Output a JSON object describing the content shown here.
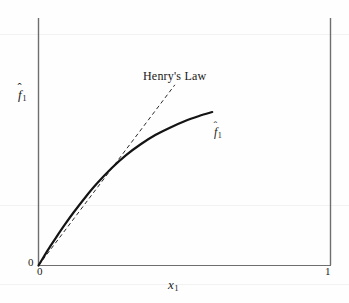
{
  "figure": {
    "background_color": "#fefefe",
    "ink_color": "#1a1a1a",
    "axis_color": "#6e6e6e"
  },
  "labels": {
    "y_axis_base": "f",
    "y_axis_hat": "ˆ",
    "y_axis_sub": "1",
    "y_axis_full": "f̂1",
    "x_axis_base": "x",
    "x_axis_sub": "1",
    "x_axis_full": "x1",
    "curve_base": "f",
    "curve_hat": "ˆ",
    "curve_sub": "1",
    "curve_full": "f̂1",
    "henry_law": "Henry's Law"
  },
  "ticks": {
    "y_origin": "0",
    "x_origin": "0",
    "x_max": "1"
  },
  "chart_data": {
    "type": "line",
    "title": "",
    "subtitle": "",
    "xlabel": "x1",
    "ylabel": "f̂1",
    "xlim": [
      0,
      1
    ],
    "ylim": [
      0,
      1
    ],
    "grid": false,
    "legend_position": "inline-annotations",
    "x_tick_labels": [
      "0",
      "1"
    ],
    "x_tick_values": [
      0,
      1
    ],
    "y_tick_labels": [
      "0"
    ],
    "y_tick_values": [
      0
    ],
    "annotations": [
      {
        "text": "Henry's Law",
        "x": 0.4,
        "y": 0.79,
        "describes": "dashed-line"
      },
      {
        "text": "f̂1",
        "x": 0.61,
        "y": 0.545,
        "describes": "solid-curve"
      }
    ],
    "series": [
      {
        "name": "fugacity-curve",
        "label": "f̂1",
        "style": "solid",
        "color": "#141414",
        "width": 2.2,
        "x": [
          0.0,
          0.02,
          0.04,
          0.06,
          0.09,
          0.12,
          0.16,
          0.2,
          0.25,
          0.3,
          0.35,
          0.4,
          0.45,
          0.5,
          0.55,
          0.595
        ],
        "y": [
          0.0,
          0.039,
          0.077,
          0.113,
          0.165,
          0.214,
          0.275,
          0.331,
          0.393,
          0.446,
          0.49,
          0.527,
          0.557,
          0.583,
          0.604,
          0.62
        ]
      },
      {
        "name": "henrys-law-tangent",
        "label": "Henry's Law",
        "style": "dashed",
        "color": "#2a2a2a",
        "width": 1.0,
        "dash_pattern": "4 3",
        "x": [
          0.0,
          0.467
        ],
        "y": [
          0.0,
          0.73
        ]
      }
    ],
    "axes": {
      "left_spine": true,
      "bottom_spine": true,
      "right_spine": true,
      "top_spine": false
    }
  }
}
